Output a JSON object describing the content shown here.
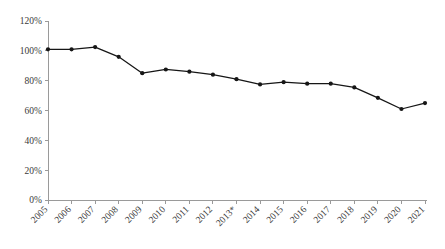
{
  "chart_data": {
    "type": "line",
    "title": "",
    "subtitle": "",
    "xlabel": "",
    "ylabel": "",
    "categories": [
      "2005",
      "2006",
      "2007",
      "2008",
      "2009",
      "2010",
      "2011",
      "2012",
      "2013*",
      "2014",
      "2015",
      "2016",
      "2017",
      "2018",
      "2019",
      "2020",
      "2021"
    ],
    "values": [
      101,
      101,
      102.5,
      96,
      85,
      87.5,
      86,
      84,
      81,
      77.5,
      79,
      78,
      78,
      75.5,
      68.5,
      61,
      65
    ],
    "series": [
      {
        "name": "Index",
        "values": [
          101,
          101,
          102.5,
          96,
          85,
          87.5,
          86,
          84,
          81,
          77.5,
          79,
          78,
          78,
          75.5,
          68.5,
          61,
          65
        ]
      }
    ],
    "ylim": [
      0,
      120
    ],
    "ytick_values": [
      0,
      20,
      40,
      60,
      80,
      100,
      120
    ],
    "ytick_labels": [
      "0%",
      "20%",
      "40%",
      "60%",
      "80%",
      "100%",
      "120%"
    ],
    "xtick_labels": [
      "2005",
      "2006",
      "2007",
      "2008",
      "2009",
      "2010",
      "2011",
      "2012",
      "2013*",
      "2014",
      "2015",
      "2016",
      "2017",
      "2018",
      "2019",
      "2020",
      "2021"
    ],
    "xtick_rotation_degrees": -45,
    "grid": false,
    "legend": false,
    "legend_position": "none",
    "marker": "circle",
    "line_color": "#161616",
    "marker_color": "#161616",
    "axis_color": "#9a9a9a",
    "background_color": "#ffffff",
    "annotations": []
  }
}
